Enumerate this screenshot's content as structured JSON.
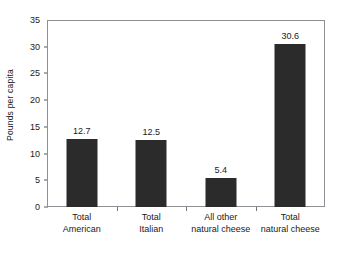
{
  "chart_data": {
    "type": "bar",
    "title": "",
    "subtitle": "",
    "xlabel": "",
    "ylabel": "Pounds per capita",
    "ylim": [
      0,
      35
    ],
    "yticks": [
      0,
      5,
      10,
      15,
      20,
      25,
      30,
      35
    ],
    "ytick_labels": [
      "0",
      "5",
      "10",
      "15",
      "20",
      "25",
      "30",
      "35"
    ],
    "grid": false,
    "legend": null,
    "bar_color": "#2b2b2b",
    "frame_color": "#8d9094",
    "categories": [
      "Total American",
      "Total Italian",
      "All other natural cheese",
      "Total natural cheese"
    ],
    "category_lines": [
      [
        "Total",
        "American"
      ],
      [
        "Total",
        "Italian"
      ],
      [
        "All other",
        "natural cheese"
      ],
      [
        "Total",
        "natural cheese"
      ]
    ],
    "values": [
      12.7,
      12.5,
      5.4,
      30.6
    ],
    "value_labels": [
      "12.7",
      "12.5",
      "5.4",
      "30.6"
    ]
  }
}
